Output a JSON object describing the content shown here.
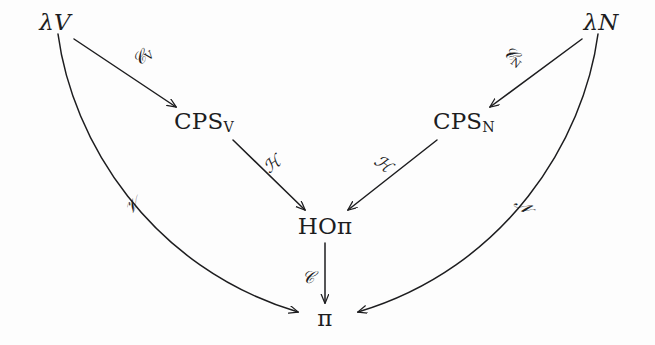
{
  "diagram": {
    "background_color": "#fdfdfd",
    "ink_color": "#1d1d1f",
    "nodes": [
      {
        "id": "lamV",
        "label": "λV",
        "lambda": "λ",
        "base": "V",
        "sub": "",
        "x": 55,
        "y": 22
      },
      {
        "id": "lamN",
        "label": "λN",
        "lambda": "λ",
        "base": "N",
        "sub": "",
        "x": 601,
        "y": 22
      },
      {
        "id": "cpsV",
        "label": "CPSᴠ",
        "lambda": "",
        "base": "CPS",
        "sub": "V",
        "x": 204,
        "y": 122
      },
      {
        "id": "cpsN",
        "label": "CPSɴ",
        "lambda": "",
        "base": "CPS",
        "sub": "N",
        "x": 464,
        "y": 122
      },
      {
        "id": "hopi",
        "label": "HOπ",
        "lambda": "",
        "base": "HO",
        "sub": "",
        "x": 325,
        "y": 226
      },
      {
        "id": "pi",
        "label": "π",
        "lambda": "",
        "base": "",
        "sub": "",
        "x": 325,
        "y": 318
      }
    ],
    "edges": [
      {
        "id": "e-cv",
        "from": "lamV",
        "to": "cpsV",
        "label": "𝒞",
        "sub": "V",
        "label_x": 143,
        "label_y": 57,
        "rotate": "rot-l"
      },
      {
        "id": "e-cn",
        "from": "lamN",
        "to": "cpsN",
        "label": "𝒞",
        "sub": "N",
        "label_x": 513,
        "label_y": 57,
        "rotate": "rot-r"
      },
      {
        "id": "e-hv",
        "from": "cpsV",
        "to": "hopi",
        "label": "ℋ",
        "sub": "",
        "label_x": 272,
        "label_y": 164,
        "rotate": "rot-l"
      },
      {
        "id": "e-hn",
        "from": "cpsN",
        "to": "hopi",
        "label": "ℋ",
        "sub": "",
        "label_x": 383,
        "label_y": 164,
        "rotate": "rot-r"
      },
      {
        "id": "e-c",
        "from": "hopi",
        "to": "pi",
        "label": "𝒞",
        "sub": "",
        "label_x": 308,
        "label_y": 277,
        "rotate": ""
      },
      {
        "id": "e-v",
        "from": "lamV",
        "to": "pi",
        "label": "𝒱",
        "sub": "",
        "label_x": 132,
        "label_y": 206,
        "rotate": "rot-l"
      },
      {
        "id": "e-n",
        "from": "lamN",
        "to": "pi",
        "label": "𝒩",
        "sub": "",
        "label_x": 523,
        "label_y": 206,
        "rotate": "rot-r"
      }
    ],
    "node_labels": {
      "lamV_text": "λV",
      "lamN_text": "λN",
      "cps_text": "CPS",
      "cpsV_sub": "V",
      "cpsN_sub": "N",
      "hopi_text": "HOπ",
      "pi_text": "π"
    },
    "edge_labels": {
      "cv": "𝒞",
      "cv_sub": "V",
      "cn": "𝒞",
      "cn_sub": "N",
      "h_left": "ℋ",
      "h_right": "ℋ",
      "c": "𝒞",
      "v": "𝒱",
      "n": "𝒩"
    }
  }
}
